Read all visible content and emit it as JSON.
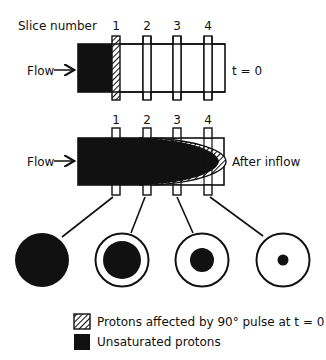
{
  "diagram": {
    "title_label": "Slice number",
    "slice_numbers": [
      "1",
      "2",
      "3",
      "4"
    ],
    "top_panel": {
      "flow_label": "Flow",
      "state_label": "t = 0"
    },
    "bottom_panel": {
      "flow_label": "Flow",
      "state_label": "After inflow"
    },
    "cross_sections": [
      {
        "slice": "1",
        "unsaturated_fraction": "full"
      },
      {
        "slice": "2",
        "unsaturated_fraction": "large"
      },
      {
        "slice": "3",
        "unsaturated_fraction": "medium"
      },
      {
        "slice": "4",
        "unsaturated_fraction": "small"
      }
    ],
    "legend": [
      {
        "swatch": "hatched",
        "label": "Protons affected by 90° pulse at t = 0"
      },
      {
        "swatch": "solid-black",
        "label": "Unsaturated protons"
      }
    ],
    "colors": {
      "ink": "#111111",
      "background": "#ffffff"
    }
  }
}
